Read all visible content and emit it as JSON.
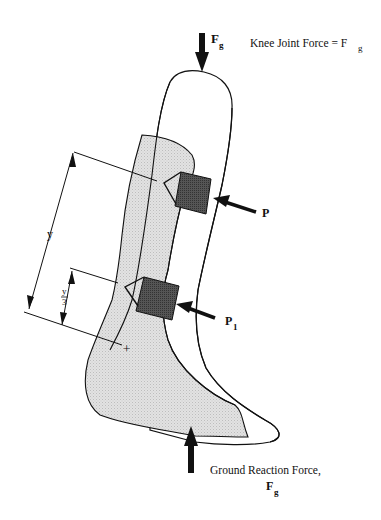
{
  "diagram": {
    "type": "orthosis-force-diagram",
    "labels": {
      "top_force_symbol": "F",
      "top_force_sub": "g",
      "knee_joint_text": "Knee Joint Force = F",
      "knee_joint_sub": "g",
      "upper_pad_force": "P",
      "lower_pad_force": "P",
      "lower_pad_sub": "1",
      "dimension_y": "y",
      "dimension_y3_num": "y",
      "dimension_y3_den": "3",
      "center_mark": "+",
      "ground_force_text": "Ground Reaction Force,",
      "ground_force_symbol": "F",
      "ground_force_sub": "g"
    },
    "colors": {
      "line": "#111111",
      "shell_fill": "#ffffff",
      "limb_fill": "#d9d9d9",
      "pad_fill": "#4a4a4a",
      "arrow": "#111111"
    }
  }
}
